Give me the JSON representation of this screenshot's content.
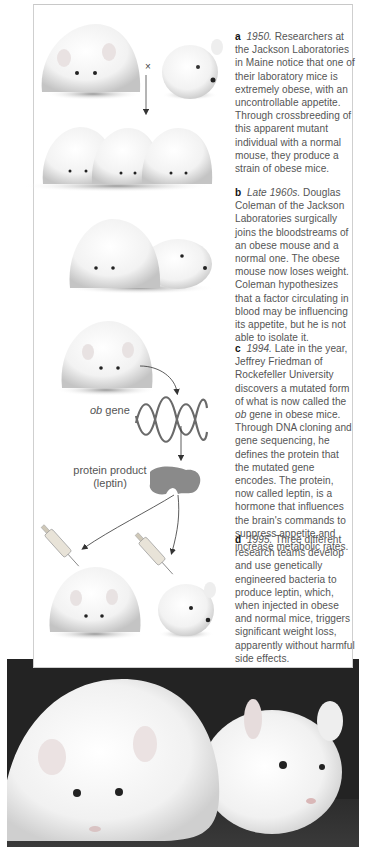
{
  "figure": {
    "panels": [
      {
        "letter": "a",
        "date": "1950.",
        "text": " Researchers at the Jackson Laboratories in Maine notice that one of their laboratory mice is extremely obese, with an uncontrollable appetite. Through crossbreeding of this apparent mutant individual with a normal mouse, they produce a strain of obese mice."
      },
      {
        "letter": "b",
        "date": "Late 1960s.",
        "text": " Douglas Coleman of the Jackson Laboratories surgically joins the bloodstreams of an obese mouse and a normal one. The obese mouse now loses weight. Coleman hypothesizes that a factor circulating in blood may be influencing its appetite, but he is not able to isolate it."
      },
      {
        "letter": "c",
        "date": "1994.",
        "text_before": " Late in the year, Jeffrey Friedman of Rockefeller University discovers a mutated form of what is now called the ",
        "italic": "ob",
        "text_after": " gene in obese mice. Through DNA cloning and gene sequencing, he defines the protein that the mutated gene encodes. The protein, now called leptin, is a hormone that influences the brain's commands to suppress appetite and increase metabolic rates."
      },
      {
        "letter": "d",
        "date": "1995.",
        "text": " Three different research teams develop and use genetically engineered bacteria to produce leptin, which, when injected in obese and normal mice, triggers significant weight loss, apparently without harmful side effects."
      }
    ],
    "labels": {
      "cross_symbol": "×",
      "ob_italic": "ob",
      "ob_gene_suffix": " gene",
      "protein_line1": "protein product",
      "protein_line2": "(leptin)"
    },
    "colors": {
      "photo_background": "#262626",
      "caption_text": "#555555",
      "letter_text": "#111111",
      "protein": "#8a8a8a",
      "dna": "#6a6a6a"
    }
  }
}
